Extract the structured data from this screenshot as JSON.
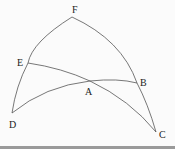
{
  "diagram": {
    "type": "spherical-triangle-construction",
    "points": [
      {
        "id": "F",
        "label": "F",
        "x": 72,
        "y": 17
      },
      {
        "id": "E",
        "label": "E",
        "x": 28,
        "y": 63
      },
      {
        "id": "A",
        "label": "A",
        "x": 90,
        "y": 81
      },
      {
        "id": "B",
        "label": "B",
        "x": 137,
        "y": 83
      },
      {
        "id": "D",
        "label": "D",
        "x": 12,
        "y": 113
      },
      {
        "id": "C",
        "label": "C",
        "x": 156,
        "y": 132
      }
    ],
    "arcs": [
      {
        "from": "F",
        "to": "D",
        "via": "E"
      },
      {
        "from": "F",
        "to": "C",
        "via": "B"
      },
      {
        "from": "E",
        "to": "C",
        "via": "A"
      },
      {
        "from": "D",
        "to": "B",
        "via": "A"
      }
    ],
    "line_color": "#555555"
  }
}
